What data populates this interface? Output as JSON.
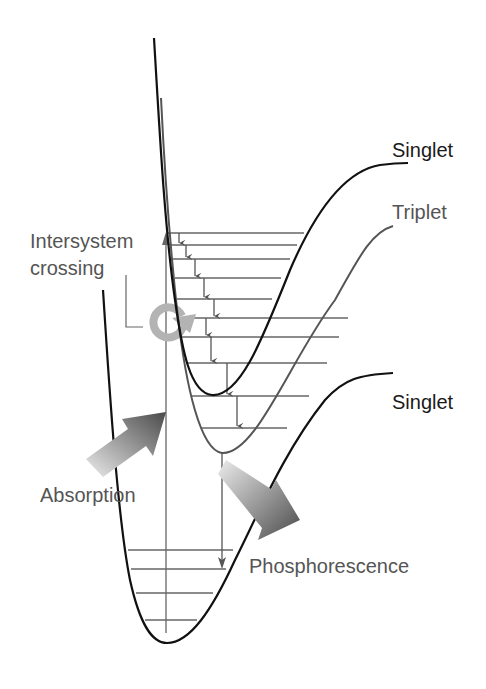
{
  "diagram": {
    "labels": {
      "singlet_upper": "Singlet",
      "triplet": "Triplet",
      "singlet_lower": "Singlet",
      "intersystem_line1": "Intersystem",
      "intersystem_line2": "crossing",
      "absorption": "Absorption",
      "phosphorescence": "Phosphorescence"
    },
    "curves": [
      {
        "name": "excited-singlet",
        "color": "#111111"
      },
      {
        "name": "triplet",
        "color": "#555555"
      },
      {
        "name": "ground-singlet",
        "color": "#111111"
      }
    ],
    "arrows": [
      {
        "name": "absorption-arrow",
        "direction": "up-right",
        "gradient": [
          "#e6e6e6",
          "#555555"
        ]
      },
      {
        "name": "phosphorescence-arrow",
        "direction": "down-right",
        "gradient": [
          "#e6e6e6",
          "#555555"
        ]
      }
    ],
    "colors": {
      "black_curve": "#111111",
      "gray_curve": "#555555",
      "level_line": "#666666",
      "crossing_symbol": "#b3b3b3",
      "label_text": "#555555"
    }
  }
}
